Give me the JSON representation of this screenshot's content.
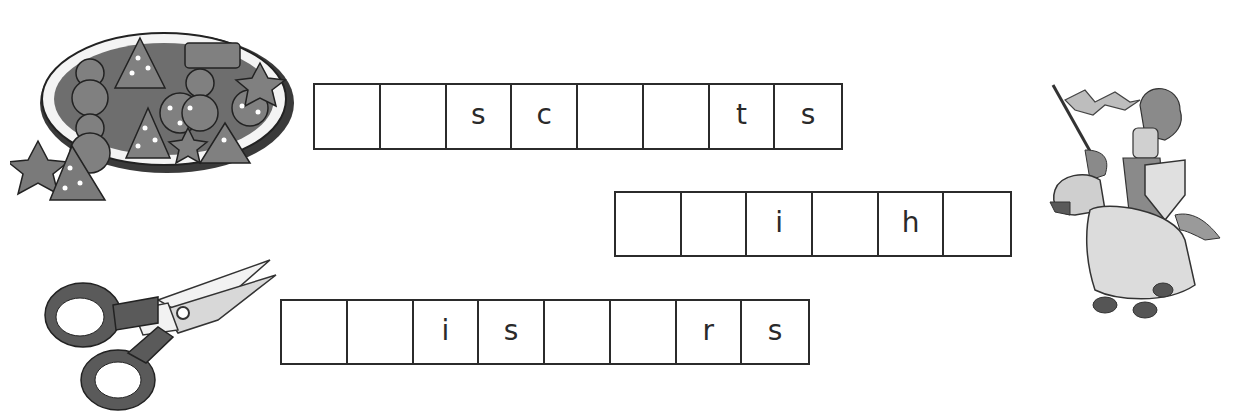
{
  "puzzle": {
    "rows": [
      {
        "picture": "biscuits",
        "cells": [
          "",
          "",
          "s",
          "c",
          "",
          "",
          "t",
          "s"
        ]
      },
      {
        "picture": "knight",
        "cells": [
          "",
          "",
          "i",
          "",
          "h",
          ""
        ]
      },
      {
        "picture": "scissors",
        "cells": [
          "",
          "",
          "i",
          "s",
          "",
          "",
          "r",
          "s"
        ]
      }
    ]
  },
  "icons": {
    "biscuits": "biscuits-plate-icon",
    "knight": "knight-on-horse-icon",
    "scissors": "scissors-icon"
  },
  "colors": {
    "border": "#2b2b2b",
    "illustration_dark": "#555555",
    "illustration_mid": "#8a8a8a",
    "illustration_light": "#cfcfcf"
  }
}
